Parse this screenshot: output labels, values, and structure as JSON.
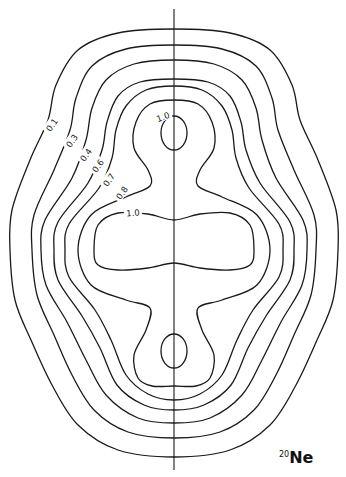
{
  "figure": {
    "label": {
      "mass_number": "20",
      "symbol": "Ne"
    },
    "axis": {
      "x": 174,
      "y_top": 9,
      "y_bottom": 470
    },
    "contour_levels": [
      "0.1",
      "0.3",
      "0.4",
      "0.6",
      "0.7",
      "0.8",
      "1.0"
    ],
    "stroke_color": "#1a1a1a",
    "background": "#ffffff"
  },
  "chart_data": {
    "type": "contour",
    "title": "20Ne",
    "levels": [
      0.1,
      0.3,
      0.4,
      0.6,
      0.7,
      0.8,
      1.0
    ],
    "level_labels": [
      {
        "text": "0.1",
        "x": 52,
        "y": 125
      },
      {
        "text": "0.3",
        "x": 72,
        "y": 141
      },
      {
        "text": "0.4",
        "x": 86,
        "y": 155
      },
      {
        "text": "0.6",
        "x": 98,
        "y": 166
      },
      {
        "text": "0.7",
        "x": 109,
        "y": 180
      },
      {
        "text": "0.8",
        "x": 122,
        "y": 193
      },
      {
        "text": "1.0",
        "x": 133,
        "y": 213
      },
      {
        "text": "1.0",
        "x": 163,
        "y": 117
      }
    ],
    "outer_contours_half_right": [
      {
        "level": "0.1",
        "points": [
          [
            174,
            29
          ],
          [
            230,
            33
          ],
          [
            270,
            50
          ],
          [
            292,
            85
          ],
          [
            300,
            120
          ],
          [
            318,
            160
          ],
          [
            336,
            210
          ],
          [
            338,
            250
          ],
          [
            333,
            300
          ],
          [
            317,
            340
          ],
          [
            296,
            385
          ],
          [
            270,
            425
          ],
          [
            230,
            450
          ],
          [
            174,
            457
          ]
        ]
      },
      {
        "level": "0.3",
        "points": [
          [
            174,
            45
          ],
          [
            222,
            49
          ],
          [
            256,
            66
          ],
          [
            272,
            98
          ],
          [
            278,
            130
          ],
          [
            294,
            170
          ],
          [
            314,
            215
          ],
          [
            316,
            250
          ],
          [
            311,
            295
          ],
          [
            294,
            335
          ],
          [
            276,
            375
          ],
          [
            254,
            410
          ],
          [
            220,
            432
          ],
          [
            174,
            438
          ]
        ]
      },
      {
        "level": "0.4",
        "points": [
          [
            174,
            60
          ],
          [
            214,
            64
          ],
          [
            242,
            80
          ],
          [
            256,
            108
          ],
          [
            262,
            140
          ],
          [
            276,
            178
          ],
          [
            303,
            220
          ],
          [
            307,
            250
          ],
          [
            302,
            285
          ],
          [
            281,
            322
          ],
          [
            262,
            360
          ],
          [
            242,
            395
          ],
          [
            210,
            418
          ],
          [
            174,
            423
          ]
        ]
      },
      {
        "level": "0.6",
        "points": [
          [
            174,
            79
          ],
          [
            208,
            82
          ],
          [
            230,
            96
          ],
          [
            241,
            122
          ],
          [
            246,
            150
          ],
          [
            260,
            183
          ],
          [
            290,
            222
          ],
          [
            294,
            250
          ],
          [
            290,
            280
          ],
          [
            266,
            316
          ],
          [
            248,
            348
          ],
          [
            231,
            385
          ],
          [
            204,
            405
          ],
          [
            174,
            410
          ]
        ]
      },
      {
        "level": "0.7",
        "points": [
          [
            174,
            86
          ],
          [
            202,
            90
          ],
          [
            222,
            106
          ],
          [
            232,
            130
          ],
          [
            236,
            158
          ],
          [
            249,
            188
          ],
          [
            279,
            224
          ],
          [
            283,
            250
          ],
          [
            279,
            277
          ],
          [
            253,
            310
          ],
          [
            237,
            340
          ],
          [
            222,
            375
          ],
          [
            200,
            394
          ],
          [
            174,
            400
          ]
        ]
      },
      {
        "level": "0.8",
        "points": [
          [
            174,
            100
          ],
          [
            198,
            104
          ],
          [
            212,
            122
          ],
          [
            214,
            148
          ],
          [
            200,
            170
          ],
          [
            198,
            186
          ],
          [
            222,
            197
          ],
          [
            257,
            215
          ],
          [
            270,
            250
          ],
          [
            257,
            285
          ],
          [
            222,
            300
          ],
          [
            198,
            308
          ],
          [
            202,
            330
          ],
          [
            214,
            355
          ],
          [
            210,
            378
          ],
          [
            196,
            386
          ],
          [
            174,
            386
          ]
        ]
      }
    ],
    "central_contour_1_0": {
      "level": "1.0",
      "points_half_right": [
        [
          174,
          220
        ],
        [
          200,
          214
        ],
        [
          230,
          213
        ],
        [
          250,
          225
        ],
        [
          254,
          250
        ],
        [
          250,
          265
        ],
        [
          230,
          270
        ],
        [
          200,
          268
        ],
        [
          174,
          263
        ]
      ]
    },
    "lobes_1_0": [
      {
        "center": [
          174,
          133
        ],
        "rx": 13,
        "ry": 17
      },
      {
        "center": [
          174,
          351
        ],
        "rx": 13,
        "ry": 17
      }
    ]
  }
}
